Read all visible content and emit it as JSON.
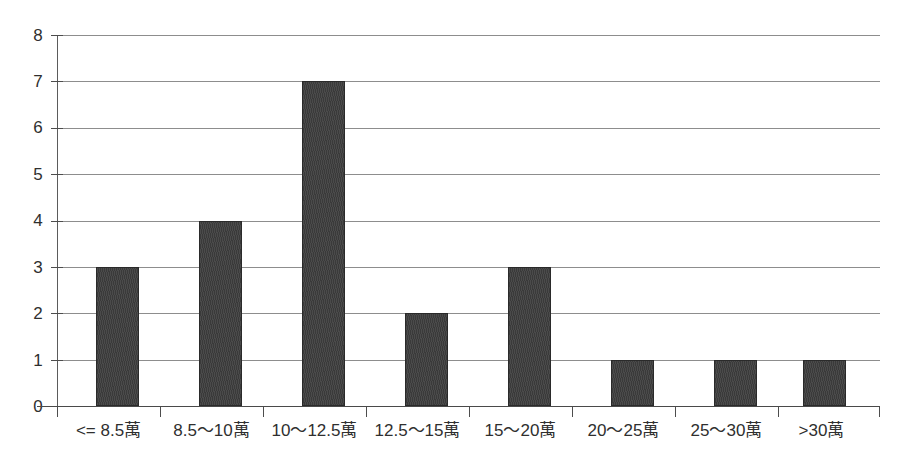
{
  "chart_data": {
    "type": "bar",
    "title": "",
    "subtitle": "",
    "xlabel": "",
    "ylabel": "",
    "categories": [
      "<= 8.5萬",
      "8.5～10萬",
      "10～12.5萬",
      "12.5～15萬",
      "15～20萬",
      "20～25萬",
      "25～30萬",
      ">30萬"
    ],
    "values": [
      3,
      4,
      7,
      2,
      3,
      1,
      1,
      1
    ],
    "ylim": [
      0,
      8
    ],
    "ytick_labels": [
      "0",
      "1",
      "2",
      "3",
      "4",
      "5",
      "6",
      "7",
      "8"
    ],
    "ytick_values": [
      0,
      1,
      2,
      3,
      4,
      5,
      6,
      7,
      8
    ],
    "grid": true,
    "grid_axis": "y",
    "legend": false,
    "legend_position": "none",
    "bar_color": "#3d3d3d",
    "grid_color": "#8d8d8d",
    "axis_color": "#4a4a4a",
    "background_color": "#ffffff",
    "text_color": "#2f2f2f"
  }
}
